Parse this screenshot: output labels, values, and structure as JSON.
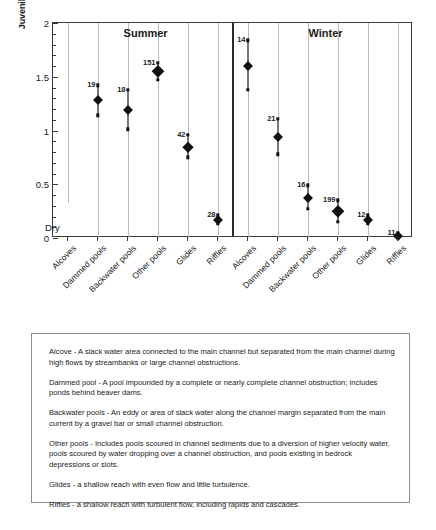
{
  "chart_data": {
    "type": "scatter",
    "title": "",
    "xlabel": "",
    "ylabel": "Juvenile Coho Salmon Density (# / square meter)",
    "ylim": [
      0,
      2
    ],
    "yticks": [
      0,
      0.5,
      1,
      1.5,
      2
    ],
    "ytick_labels": [
      "0",
      "0.5",
      "1",
      "1.5",
      "2"
    ],
    "grid": "vertical-category-lines",
    "legend": "none",
    "panels": [
      {
        "name": "Summer",
        "categories": [
          "Alcoves",
          "Dammed pools",
          "Backwater pools",
          "Other pools",
          "Glides",
          "Riffles"
        ],
        "points": [
          {
            "category": "Alcoves",
            "mean": null,
            "low": null,
            "high": null,
            "n": null,
            "note": "Dry"
          },
          {
            "category": "Dammed pools",
            "mean": 1.28,
            "low": 1.14,
            "high": 1.42,
            "n": "19"
          },
          {
            "category": "Backwater pools",
            "mean": 1.19,
            "low": 1.01,
            "high": 1.38,
            "n": "18"
          },
          {
            "category": "Other pools",
            "mean": 1.55,
            "low": 1.47,
            "high": 1.63,
            "n": "151"
          },
          {
            "category": "Glides",
            "mean": 0.85,
            "low": 0.75,
            "high": 0.96,
            "n": "42"
          },
          {
            "category": "Riffles",
            "mean": 0.17,
            "low": 0.13,
            "high": 0.21,
            "n": "28"
          }
        ]
      },
      {
        "name": "Winter",
        "categories": [
          "Alcoves",
          "Dammed pools",
          "Backwater pools",
          "Other pools",
          "Glides",
          "Riffles"
        ],
        "points": [
          {
            "category": "Alcoves",
            "mean": 1.6,
            "low": 1.38,
            "high": 1.84,
            "n": "14"
          },
          {
            "category": "Dammed pools",
            "mean": 0.94,
            "low": 0.78,
            "high": 1.11,
            "n": "21"
          },
          {
            "category": "Backwater pools",
            "mean": 0.37,
            "low": 0.27,
            "high": 0.49,
            "n": "16"
          },
          {
            "category": "Other pools",
            "mean": 0.25,
            "low": 0.15,
            "high": 0.35,
            "n": "199"
          },
          {
            "category": "Glides",
            "mean": 0.17,
            "low": 0.13,
            "high": 0.21,
            "n": "12"
          },
          {
            "category": "Riffles",
            "mean": 0.02,
            "low": 0.0,
            "high": 0.05,
            "n": "11"
          }
        ]
      }
    ],
    "annotations": [
      {
        "text": "Dry",
        "panel": "Summer",
        "category": "Alcoves"
      }
    ],
    "marker_style": "filled diamond with vertical confidence interval whiskers; number above each point is sample size (n)"
  },
  "definitions": [
    {
      "term": "Alcove",
      "text": "Alcove  -  A slack water area connected to the main channel but separated from the main channel during high flows by streambanks or large channel obstructions."
    },
    {
      "term": "Dammed pool",
      "text": "Dammed pool  -  A pool impounded by a complete or nearly complete channel obstruction; includes ponds behind beaver dams."
    },
    {
      "term": "Backwater pools",
      "text": "Backwater pools  -  An eddy or area of slack water along the channel margin separated from the main current by a gravel bar or small channel obstruction."
    },
    {
      "term": "Other pools",
      "text": "Other pools  -  Includes pools scoured in channel sediments due to a diversion of higher velocity water, pools scoured by water dropping over a channel obstruction, and pools existing in bedrock depressions or slots."
    },
    {
      "term": "Glides",
      "text": "Glides  -  a shallow reach with even flow and little turbulence."
    },
    {
      "term": "Riffles",
      "text": "Riffles  -  a shallow reach with turbulent flow, including rapids and cascades."
    }
  ],
  "colors": {
    "marker": "#111111",
    "gridline": "#b9b9b9",
    "axis": "#3a3a3a",
    "box_border": "#8d8d8d"
  }
}
